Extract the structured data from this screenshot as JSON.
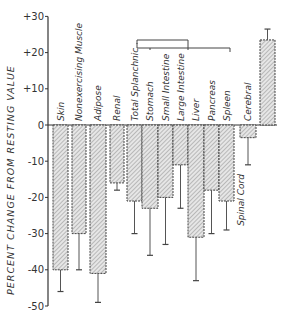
{
  "chart_data": {
    "type": "bar",
    "title": "",
    "xlabel": "",
    "ylabel": "PERCENT CHANGE FROM RESTING VALUE",
    "ylim": [
      -50,
      30
    ],
    "yticks": [
      30,
      20,
      10,
      0,
      -10,
      -20,
      -30,
      -40,
      -50
    ],
    "ytick_labels": [
      "+30",
      "+20",
      "+10",
      "0",
      "-10",
      "-20",
      "-30",
      "-40",
      "-50"
    ],
    "grid": false,
    "legend": null,
    "bar_style": "hatched",
    "error_bars": true,
    "categories": [
      "Skin",
      "Nonexercising Muscle",
      "Adipose",
      "Renal",
      "Total Splanchnic",
      "Stomach",
      "Small Intestine",
      "Large Intestine",
      "Liver",
      "Pancreas",
      "Spleen",
      "Cerebral",
      "Spinal Cord"
    ],
    "values": [
      -40,
      -30,
      -41,
      -16,
      -21,
      -23,
      -20,
      -11,
      -31,
      -18,
      -21,
      -3.5,
      23.5
    ],
    "error_ends": [
      -46,
      -40,
      -49,
      -18,
      -30,
      -36,
      -33,
      -23,
      -43,
      -30,
      -29,
      -11,
      26.5
    ],
    "annotations": [
      {
        "type": "bracket",
        "text": "",
        "groups": "Total Splanchnic encompasses Stomach, Small Intestine, Large Intestine, Liver, Pancreas, Spleen"
      }
    ]
  },
  "colors": {
    "axis": "#333333",
    "bar_fill": "#e4e4e4",
    "hatch": "#8a8a8a",
    "bar_border": "#444444"
  }
}
